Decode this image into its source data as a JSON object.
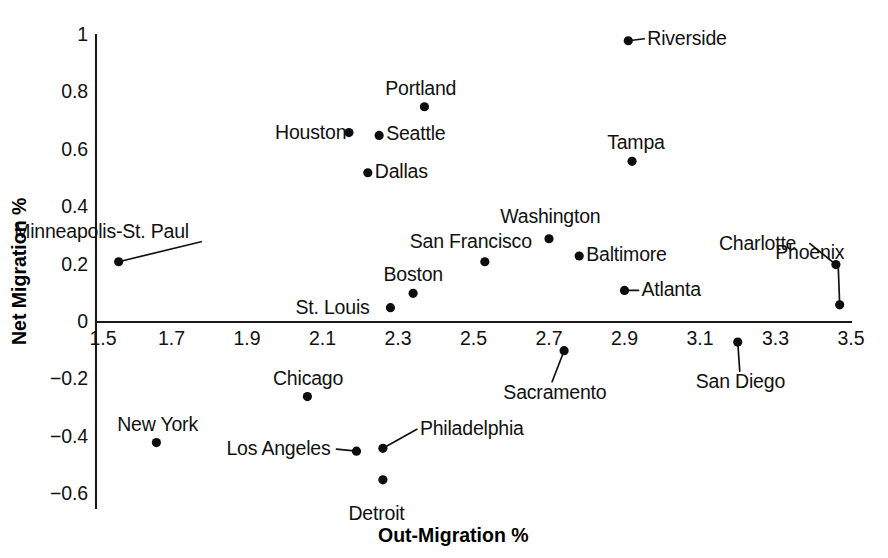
{
  "chart_data": {
    "type": "scatter",
    "title": "",
    "xlabel": "Out-Migration %",
    "ylabel": "Net Migration %",
    "xlim": [
      1.5,
      3.5
    ],
    "ylim": [
      -0.6,
      1.0
    ],
    "xticks": [
      "1.5",
      "1.7",
      "1.9",
      "2.1",
      "2.3",
      "2.5",
      "2.7",
      "2.9",
      "3.1",
      "3.3",
      "3.5"
    ],
    "xtick_values": [
      1.5,
      1.7,
      1.9,
      2.1,
      2.3,
      2.5,
      2.7,
      2.9,
      3.1,
      3.3,
      3.5
    ],
    "yticks": [
      "1",
      "0.8",
      "0.6",
      "0.4",
      "0.2",
      "0",
      "−0.2",
      "−0.4",
      "−0.6"
    ],
    "ytick_values": [
      1,
      0.8,
      0.6,
      0.4,
      0.2,
      0,
      -0.2,
      -0.4,
      -0.6
    ],
    "grid": false,
    "legend": "none",
    "marker_color": "#0d0d0d",
    "axis_color": "#1a1a1a",
    "points": [
      {
        "label": "Riverside",
        "x": 2.91,
        "y": 0.98,
        "label_pos": "right",
        "leader": true
      },
      {
        "label": "Portland",
        "x": 2.37,
        "y": 0.75,
        "label_pos": "above",
        "leader": false
      },
      {
        "label": "Houston",
        "x": 2.17,
        "y": 0.66,
        "label_pos": "left",
        "leader": false
      },
      {
        "label": "Seattle",
        "x": 2.25,
        "y": 0.65,
        "label_pos": "right",
        "leader": false
      },
      {
        "label": "Tampa",
        "x": 2.92,
        "y": 0.56,
        "label_pos": "above",
        "leader": false
      },
      {
        "label": "Dallas",
        "x": 2.22,
        "y": 0.52,
        "label_pos": "right",
        "leader": false
      },
      {
        "label": "Washington",
        "x": 2.7,
        "y": 0.29,
        "label_pos": "above",
        "leader": false
      },
      {
        "label": "Baltimore",
        "x": 2.78,
        "y": 0.23,
        "label_pos": "right",
        "leader": false
      },
      {
        "label": "Charlotte",
        "x": 3.46,
        "y": 0.2,
        "label_pos": "left",
        "leader": true
      },
      {
        "label": "Minneapolis-St. Paul",
        "x": 1.56,
        "y": 0.21,
        "label_pos": "above",
        "leader": true
      },
      {
        "label": "San Francisco",
        "x": 2.53,
        "y": 0.21,
        "label_pos": "above",
        "leader": false
      },
      {
        "label": "Atlanta",
        "x": 2.9,
        "y": 0.11,
        "label_pos": "right",
        "leader": true
      },
      {
        "label": "Boston",
        "x": 2.34,
        "y": 0.1,
        "label_pos": "above",
        "leader": false
      },
      {
        "label": "Phoenix",
        "x": 3.47,
        "y": 0.06,
        "label_pos": "above",
        "leader": true
      },
      {
        "label": "St. Louis",
        "x": 2.28,
        "y": 0.05,
        "label_pos": "left",
        "leader": false
      },
      {
        "label": "San Diego",
        "x": 3.2,
        "y": -0.07,
        "label_pos": "below",
        "leader": true
      },
      {
        "label": "Sacramento",
        "x": 2.74,
        "y": -0.1,
        "label_pos": "below",
        "leader": true
      },
      {
        "label": "Chicago",
        "x": 2.06,
        "y": -0.26,
        "label_pos": "above",
        "leader": false
      },
      {
        "label": "New York",
        "x": 1.66,
        "y": -0.42,
        "label_pos": "above",
        "leader": false
      },
      {
        "label": "Los Angeles",
        "x": 2.19,
        "y": -0.45,
        "label_pos": "left",
        "leader": true
      },
      {
        "label": "Philadelphia",
        "x": 2.26,
        "y": -0.44,
        "label_pos": "right",
        "leader": true
      },
      {
        "label": "Detroit",
        "x": 2.26,
        "y": -0.55,
        "label_pos": "below",
        "leader": false
      }
    ]
  },
  "axis_titles": {
    "x": "Out-Migration %",
    "y": "Net Migration %"
  }
}
